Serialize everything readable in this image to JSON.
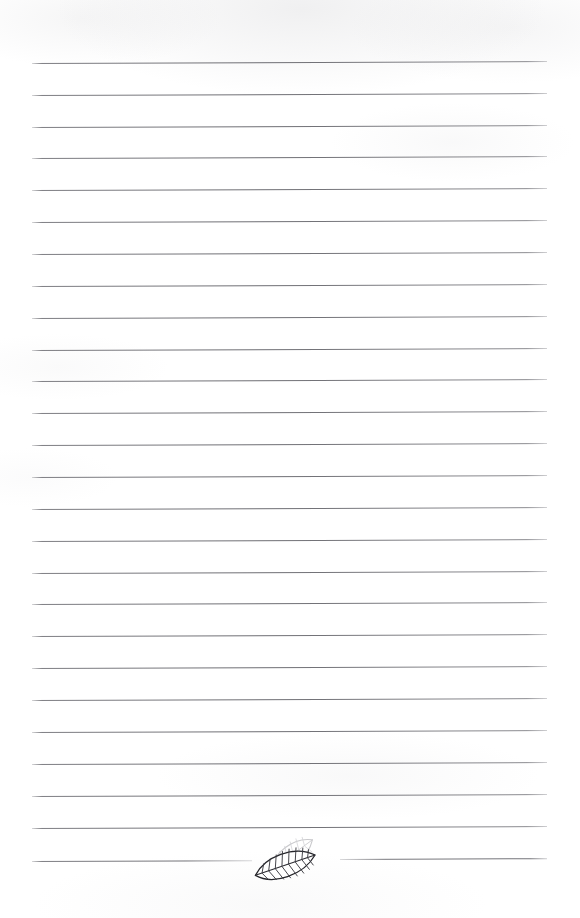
{
  "page": {
    "kind": "scanned-lined-notepaper",
    "width_px": 580,
    "height_px": 918,
    "background_color": "#ffffff",
    "text_content": "",
    "written_text": []
  },
  "ruling": {
    "line_color": "#68686e",
    "line_count": 27,
    "line_thickness_px": 1,
    "first_line_y_px": 63,
    "last_line_y_px": 861,
    "line_spacing_px": 31.9,
    "left_margin_x_px": 32,
    "right_margin_x_px": 547,
    "skew_degrees": -0.22,
    "lines": [
      {
        "index": 1,
        "y": 63,
        "x_start": 32,
        "x_end": 547,
        "split": false
      },
      {
        "index": 2,
        "y": 95,
        "x_start": 32,
        "x_end": 547,
        "split": false
      },
      {
        "index": 3,
        "y": 127,
        "x_start": 32,
        "x_end": 547,
        "split": false
      },
      {
        "index": 4,
        "y": 158,
        "x_start": 32,
        "x_end": 547,
        "split": false
      },
      {
        "index": 5,
        "y": 190,
        "x_start": 32,
        "x_end": 547,
        "split": false
      },
      {
        "index": 6,
        "y": 222,
        "x_start": 32,
        "x_end": 547,
        "split": false
      },
      {
        "index": 7,
        "y": 254,
        "x_start": 32,
        "x_end": 547,
        "split": false
      },
      {
        "index": 8,
        "y": 286,
        "x_start": 32,
        "x_end": 547,
        "split": false
      },
      {
        "index": 9,
        "y": 318,
        "x_start": 32,
        "x_end": 547,
        "split": false
      },
      {
        "index": 10,
        "y": 350,
        "x_start": 32,
        "x_end": 547,
        "split": false
      },
      {
        "index": 11,
        "y": 381,
        "x_start": 32,
        "x_end": 547,
        "split": false
      },
      {
        "index": 12,
        "y": 413,
        "x_start": 32,
        "x_end": 547,
        "split": false
      },
      {
        "index": 13,
        "y": 445,
        "x_start": 32,
        "x_end": 547,
        "split": false
      },
      {
        "index": 14,
        "y": 477,
        "x_start": 32,
        "x_end": 547,
        "split": false
      },
      {
        "index": 15,
        "y": 509,
        "x_start": 32,
        "x_end": 547,
        "split": false
      },
      {
        "index": 16,
        "y": 541,
        "x_start": 32,
        "x_end": 547,
        "split": false
      },
      {
        "index": 17,
        "y": 573,
        "x_start": 32,
        "x_end": 547,
        "split": false
      },
      {
        "index": 18,
        "y": 604,
        "x_start": 32,
        "x_end": 547,
        "split": false
      },
      {
        "index": 19,
        "y": 636,
        "x_start": 32,
        "x_end": 547,
        "split": false
      },
      {
        "index": 20,
        "y": 668,
        "x_start": 32,
        "x_end": 547,
        "split": false
      },
      {
        "index": 21,
        "y": 700,
        "x_start": 32,
        "x_end": 547,
        "split": false
      },
      {
        "index": 22,
        "y": 732,
        "x_start": 32,
        "x_end": 547,
        "split": false
      },
      {
        "index": 23,
        "y": 764,
        "x_start": 32,
        "x_end": 547,
        "split": false
      },
      {
        "index": 24,
        "y": 796,
        "x_start": 32,
        "x_end": 547,
        "split": false
      },
      {
        "index": 25,
        "y": 828,
        "x_start": 32,
        "x_end": 547,
        "split": false
      },
      {
        "index": 26,
        "y": 861,
        "x_start": 32,
        "x_end": 252,
        "split": true,
        "segment": "left"
      },
      {
        "index": 27,
        "y": 859,
        "x_start": 340,
        "x_end": 547,
        "split": true,
        "segment": "right"
      }
    ]
  },
  "ornament": {
    "name": "leaf",
    "description": "Two overlapping elongated leaves with herringbone venation at bottom-centre, interrupting the final ruled line",
    "position": {
      "x": 248,
      "y": 834,
      "width": 80,
      "height": 52
    },
    "leaves": [
      {
        "id": "back-leaf",
        "shade": "faded",
        "outline_color": "#c9c9cc",
        "vein_color": "#d4d4d7"
      },
      {
        "id": "front-leaf",
        "shade": "inked",
        "outline_color": "#25252a",
        "vein_color": "#3a3a40"
      }
    ]
  }
}
